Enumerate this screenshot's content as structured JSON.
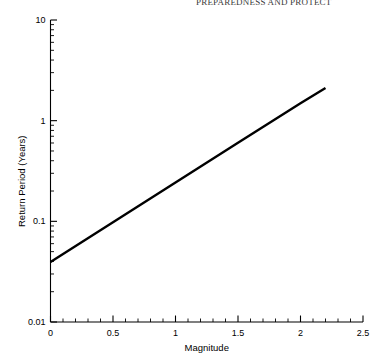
{
  "page": {
    "running_head": "PREPAREDNESS AND PROTECT",
    "bottom_caption": ""
  },
  "chart_data": {
    "type": "line",
    "title": "",
    "xlabel": "Magnitude",
    "ylabel": "Return Period (Years)",
    "xlim": [
      0,
      2.5
    ],
    "ylim": [
      0.01,
      10
    ],
    "yscale": "log",
    "xscale": "linear",
    "grid": false,
    "legend": null,
    "xticks": [
      "0",
      "0.5",
      "1",
      "1.5",
      "2",
      "2.5"
    ],
    "xtick_values": [
      0,
      0.5,
      1,
      1.5,
      2,
      2.5
    ],
    "yticks": [
      "10",
      "1",
      "0.1",
      "0.01"
    ],
    "ytick_values": [
      10,
      1,
      0.1,
      0.01
    ],
    "series": [
      {
        "name": "Return period vs magnitude",
        "x": [
          0,
          0.5,
          1.0,
          1.5,
          2.0,
          2.2
        ],
        "y": [
          0.0395,
          0.098,
          0.243,
          0.602,
          1.49,
          2.11
        ]
      }
    ],
    "annotations": []
  }
}
